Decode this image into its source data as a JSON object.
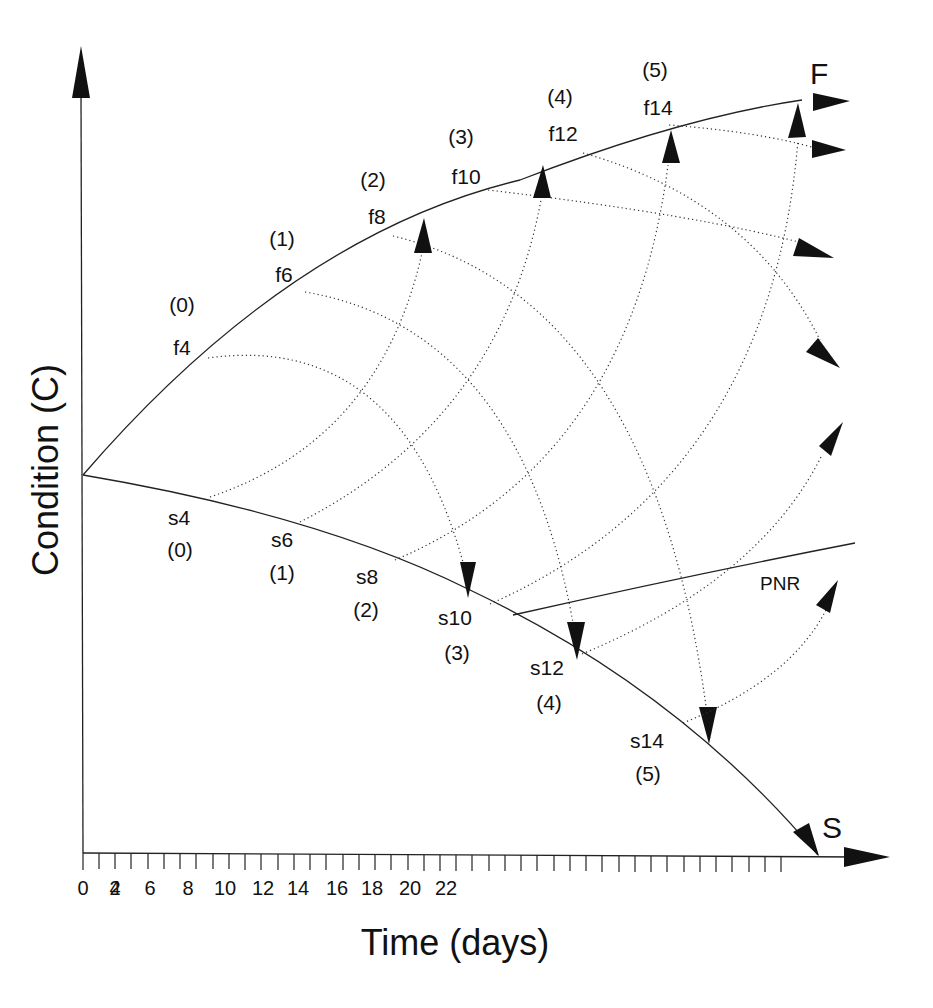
{
  "figure": {
    "y_axis_title": "Condition (C)",
    "x_axis_title": "Time (days)",
    "x_ticks": [
      "0",
      "2",
      "4",
      "6",
      "8",
      "10",
      "12",
      "14",
      "16",
      "18",
      "20",
      "22"
    ],
    "curve_labels": {
      "fast": "F",
      "slow": "S",
      "pnr": "PNR"
    },
    "f_points": [
      {
        "name": "f4",
        "stage": "(0)"
      },
      {
        "name": "f6",
        "stage": "(1)"
      },
      {
        "name": "f8",
        "stage": "(2)"
      },
      {
        "name": "f10",
        "stage": "(3)"
      },
      {
        "name": "f12",
        "stage": "(4)"
      },
      {
        "name": "f14",
        "stage": "(5)"
      }
    ],
    "s_points": [
      {
        "name": "s4",
        "stage": "(0)"
      },
      {
        "name": "s6",
        "stage": "(1)"
      },
      {
        "name": "s8",
        "stage": "(2)"
      },
      {
        "name": "s10",
        "stage": "(3)"
      },
      {
        "name": "s12",
        "stage": "(4)"
      },
      {
        "name": "s14",
        "stage": "(5)"
      }
    ],
    "transitions": [
      {
        "from": "f4",
        "to": "s10"
      },
      {
        "from": "f6",
        "to": "s12"
      },
      {
        "from": "f8",
        "to": "s14"
      },
      {
        "from": "f10",
        "to": "off-chart"
      },
      {
        "from": "f12",
        "to": "off-chart"
      },
      {
        "from": "f14",
        "to": "off-chart"
      },
      {
        "from": "s4",
        "to": "f8"
      },
      {
        "from": "s6",
        "to": "f10"
      },
      {
        "from": "s8",
        "to": "f12"
      },
      {
        "from": "s10",
        "to": "f14"
      },
      {
        "from": "s12",
        "to": "off-chart"
      },
      {
        "from": "s14",
        "to": "off-chart"
      }
    ]
  }
}
